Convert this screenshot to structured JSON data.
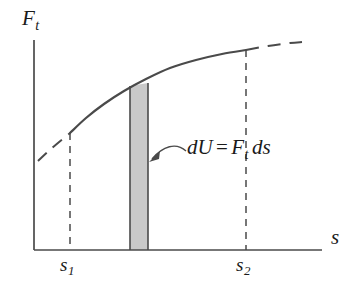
{
  "figure": {
    "kind": "line-plot-with-shaded-differential-strip",
    "background_color": "#ffffff",
    "ink_color": "#4a4a4a",
    "text_color": "#1a1a1a",
    "strip_fill_color": "#c9c9c9",
    "strip_edge_color": "#4a4a4a"
  },
  "axes": {
    "y_label": "F",
    "y_label_sub": "t",
    "x_label": "s",
    "x_axis_y": 250,
    "y_axis_x": 34,
    "x_axis_start": 34,
    "x_axis_end": 322,
    "y_axis_top": 40,
    "y_axis_bottom": 250
  },
  "ticks": [
    {
      "name": "s1",
      "base": "s",
      "sub": "1",
      "x": 70
    },
    {
      "name": "s2",
      "base": "s",
      "sub": "2",
      "x": 246
    }
  ],
  "annotation": {
    "text_parts": {
      "dU": "dU",
      "equals": "=",
      "F": "F",
      "F_sub": "t",
      "ds": "ds"
    },
    "plain_text": "dU = Ft ds",
    "x": 187,
    "y": 137
  },
  "chart_data": {
    "type": "line",
    "title": "",
    "xlabel": "s",
    "ylabel": "F_t",
    "grid": false,
    "legend": false,
    "curve_solid_points": [
      [
        70,
        133
      ],
      [
        86,
        118
      ],
      [
        104,
        104
      ],
      [
        124,
        91
      ],
      [
        146,
        79
      ],
      [
        170,
        68
      ],
      [
        196,
        60
      ],
      [
        222,
        54
      ],
      [
        246,
        50
      ]
    ],
    "curve_dashed_left_points": [
      [
        38,
        161
      ],
      [
        52,
        148
      ],
      [
        70,
        133
      ]
    ],
    "curve_dashed_right_points": [
      [
        246,
        50
      ],
      [
        268,
        46
      ],
      [
        290,
        43
      ],
      [
        302,
        42
      ]
    ],
    "vertical_droplines": [
      {
        "at": "s1",
        "x": 70,
        "y_top": 133,
        "y_bottom": 250
      },
      {
        "at": "s2",
        "x": 246,
        "y_top": 50,
        "y_bottom": 250
      }
    ],
    "shaded_strip": {
      "label": "dU = F_t ds",
      "x_left": 130,
      "x_right": 148,
      "y_top_left": 86,
      "y_top_right": 83,
      "y_bottom": 250
    },
    "leader_line": {
      "from": [
        186,
        150
      ],
      "control": [
        168,
        143
      ],
      "to": [
        150,
        160
      ],
      "arrow_at": [
        150,
        160
      ]
    }
  }
}
